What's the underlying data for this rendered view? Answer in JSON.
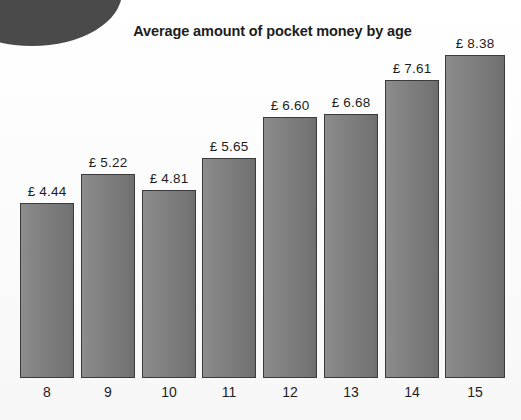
{
  "chart_data": {
    "type": "bar",
    "title": "Average amount of pocket money by age",
    "xlabel": "",
    "ylabel": "",
    "categories": [
      "8",
      "9",
      "10",
      "11",
      "12",
      "13",
      "14",
      "15"
    ],
    "values": [
      4.44,
      5.22,
      4.81,
      5.65,
      6.6,
      6.68,
      7.61,
      8.38
    ],
    "value_labels": [
      "£ 4.44",
      "£ 5.22",
      "£ 4.81",
      "£ 5.65",
      "£ 6.60",
      "£ 6.68",
      "£ 7.61",
      "£ 8.38"
    ],
    "currency": "£",
    "ylim": [
      0,
      9.2
    ],
    "grid": false,
    "legend": null,
    "bars": [
      {
        "category": "8",
        "value": 4.44,
        "label": "£ 4.44",
        "left": 20,
        "width": 54,
        "top": 203
      },
      {
        "category": "9",
        "value": 5.22,
        "label": "£ 5.22",
        "left": 81,
        "width": 54,
        "top": 174
      },
      {
        "category": "10",
        "value": 4.81,
        "label": "£ 4.81",
        "left": 142,
        "width": 54,
        "top": 190
      },
      {
        "category": "11",
        "value": 5.65,
        "label": "£ 5.65",
        "left": 202,
        "width": 54,
        "top": 158
      },
      {
        "category": "12",
        "value": 6.6,
        "label": "£ 6.60",
        "left": 263,
        "width": 54,
        "top": 117
      },
      {
        "category": "13",
        "value": 6.68,
        "label": "£ 6.68",
        "left": 324,
        "width": 54,
        "top": 114
      },
      {
        "category": "14",
        "value": 7.61,
        "label": "£ 7.61",
        "left": 385,
        "width": 54,
        "top": 80
      },
      {
        "category": "15",
        "value": 8.38,
        "label": "£ 8.38",
        "left": 445,
        "width": 60,
        "top": 55
      }
    ]
  },
  "colors": {
    "bar_fill_light": "#8d8d8d",
    "bar_fill_dark": "#6e6e6e",
    "bar_border": "#3b3b3b",
    "text": "#1d1d1d",
    "background": "#fdfdfd",
    "corner_blob": "#4a4a4a"
  },
  "decor": {
    "corner_shape": "partial-dark-ellipse"
  }
}
